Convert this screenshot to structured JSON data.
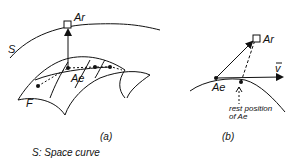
{
  "panel_a": {
    "caption": "(a)",
    "labels": {
      "space_curve": "S",
      "attractor_point": "Ar",
      "effector_point": "Ae",
      "surface": "F"
    }
  },
  "panel_b": {
    "caption": "(b)",
    "labels": {
      "attractor_point": "Ar",
      "effector_point": "Ae",
      "velocity": "v",
      "rest_position_line1": "rest position",
      "rest_position_line2": "of Ae"
    }
  },
  "legend": {
    "text": "S: Space curve"
  },
  "colors": {
    "ink": "#111111",
    "background": "#ffffff"
  }
}
